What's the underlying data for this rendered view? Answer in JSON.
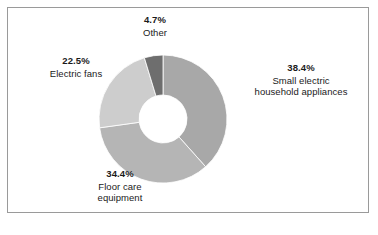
{
  "figure": {
    "background_color": "#ffffff",
    "frame_color": "#9a9a9a"
  },
  "chart_data": {
    "type": "pie",
    "variant": "donut",
    "title": "",
    "subtitle": "",
    "xlabel": "",
    "ylabel": "",
    "legend_position": "none",
    "labels_position": "outside-callouts",
    "grid": false,
    "start_angle_deg": 0,
    "direction": "clockwise",
    "inner_radius_ratio": 0.375,
    "categories": [
      "Small electric household appliances",
      "Floor care equipment",
      "Electric fans",
      "Other"
    ],
    "values": [
      38.4,
      34.4,
      22.5,
      4.7
    ],
    "value_unit": "%",
    "colors": [
      "#a8a8a8",
      "#b5b5b5",
      "#cdcdcd",
      "#6e6e6e"
    ],
    "slices": [
      {
        "name": "Small electric household appliances",
        "value": 38.4,
        "value_label": "38.4%",
        "color": "#a8a8a8",
        "label_line_1": "Small electric",
        "label_line_2": "household appliances"
      },
      {
        "name": "Floor care equipment",
        "value": 34.4,
        "value_label": "34.4%",
        "color": "#b5b5b5",
        "label_line_1": "Floor care",
        "label_line_2": "equipment"
      },
      {
        "name": "Electric fans",
        "value": 22.5,
        "value_label": "22.5%",
        "color": "#cdcdcd",
        "label_line_1": "Electric fans",
        "label_line_2": ""
      },
      {
        "name": "Other",
        "value": 4.7,
        "value_label": "4.7%",
        "color": "#6e6e6e",
        "label_line_1": "Other",
        "label_line_2": ""
      }
    ]
  }
}
